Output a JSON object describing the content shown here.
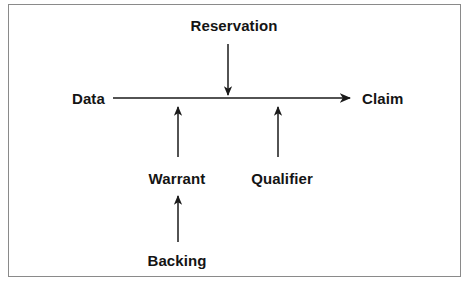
{
  "diagram": {
    "background_color": "#ffffff",
    "border_color": "#8a8a8a",
    "line_color": "#1a1a1a",
    "text_color": "#141414",
    "nodes": [
      {
        "id": "reservation",
        "label": "Reservation",
        "x": 234,
        "y": 25
      },
      {
        "id": "data",
        "label": "Data",
        "x": 72,
        "y": 98
      },
      {
        "id": "claim",
        "label": "Claim",
        "x": 406,
        "y": 98
      },
      {
        "id": "warrant",
        "label": "Warrant",
        "x": 177,
        "y": 178
      },
      {
        "id": "qualifier",
        "label": "Qualifier",
        "x": 282,
        "y": 178
      },
      {
        "id": "backing",
        "label": "Backing",
        "x": 177,
        "y": 260
      }
    ],
    "connectors": [
      {
        "id": "data-to-claim",
        "from": "data",
        "to": "claim",
        "direction": "right"
      },
      {
        "id": "reservation-to-line",
        "from": "reservation",
        "to": "claim-line",
        "direction": "down"
      },
      {
        "id": "warrant-to-line",
        "from": "warrant",
        "to": "claim-line",
        "direction": "up"
      },
      {
        "id": "qualifier-to-line",
        "from": "qualifier",
        "to": "claim-line",
        "direction": "up"
      },
      {
        "id": "backing-to-warrant",
        "from": "backing",
        "to": "warrant",
        "direction": "up"
      }
    ]
  }
}
